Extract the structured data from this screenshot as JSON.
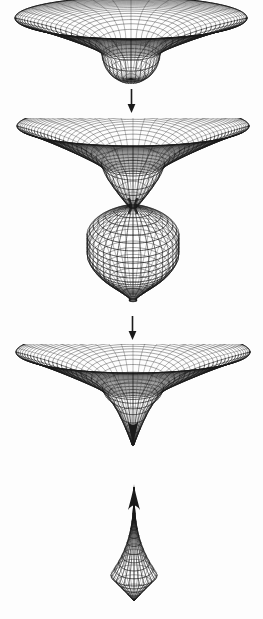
{
  "figure": {
    "title": "Wormhole pinch-off sequence",
    "background_color": "#fdfdfd",
    "line_color": "#1a1a1a",
    "width": 263,
    "height": 619,
    "panel_count": 4,
    "arrow_count": 2
  },
  "panels": [
    {
      "id": "panel-1",
      "name": "shallow-funnel",
      "description": "Embedding diagram: flat sheet with a shallow rounded dimple",
      "center_x": 131,
      "disk_top_y": 18,
      "disk_rim_half_width": 116,
      "disk_rim_half_height": 21,
      "throat_half_width": 29,
      "bottom_y": 79,
      "shape": "bowl",
      "meridians": 36,
      "rings": 13
    },
    {
      "id": "panel-2",
      "name": "necked-funnel-with-bulb",
      "description": "Embedding diagram: deep funnel narrowing to a thin neck that opens into a large bulbous baby universe",
      "center_x": 133,
      "disk_top_y": 126,
      "disk_rim_half_width": 116,
      "disk_rim_half_height": 20,
      "throat_half_width": 30,
      "neck_y": 206,
      "neck_half_width": 4,
      "bulb_top_y": 206,
      "bulb_bottom_y": 301,
      "bulb_half_width": 46,
      "shape": "neck-bulb",
      "meridians": 36,
      "rings": 22
    },
    {
      "id": "panel-3",
      "name": "pinched-cusp-funnel",
      "description": "Embedding diagram: funnel pinched off to a sharp cusp point",
      "center_x": 133,
      "disk_top_y": 352,
      "disk_rim_half_width": 117,
      "disk_rim_half_height": 21,
      "throat_half_width": 29,
      "cusp_y": 447,
      "shape": "cusp",
      "meridians": 36,
      "rings": 13
    },
    {
      "id": "panel-4",
      "name": "detached-baby-universe",
      "description": "Detached teardrop-shaped closed baby universe with a cusp at the top",
      "center_x": 134,
      "cusp_y": 484,
      "bulb_top_y": 505,
      "bulb_bottom_y": 601,
      "bulb_half_width": 47,
      "shape": "teardrop",
      "meridians": 28,
      "rings": 16
    }
  ],
  "arrows": [
    {
      "id": "arrow-1",
      "name": "downward-arrow-1",
      "x": 131,
      "y_start": 90,
      "y_end": 112,
      "direction": "down"
    },
    {
      "id": "arrow-2",
      "name": "downward-arrow-2",
      "x": 132,
      "y_start": 316,
      "y_end": 339,
      "direction": "down"
    }
  ]
}
